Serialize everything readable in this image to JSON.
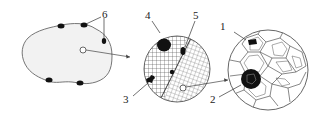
{
  "diagram": {
    "type": "microstructure-magnification-schematic",
    "panels": [
      {
        "id": "macro-section",
        "description": "Cross-section outline with dark surface inclusions and a magnified spot"
      },
      {
        "id": "meso-view",
        "description": "Magnified circle with cross-hatched grains, dark inclusions and a white spot"
      },
      {
        "id": "micro-view",
        "description": "Further magnified circle showing polyhedral grain structure with dark particles"
      }
    ],
    "labels": {
      "l1": "1",
      "l2": "2",
      "l3": "3",
      "l4": "4",
      "l5": "5",
      "l6": "6"
    },
    "colors": {
      "line": "#555555",
      "fill_blob": "#f2f2f2",
      "dark": "#111111",
      "background": "#ffffff"
    }
  }
}
